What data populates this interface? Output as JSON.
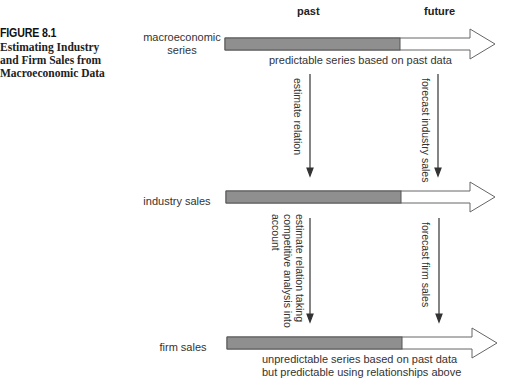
{
  "figure": {
    "number": "FIGURE 8.1",
    "title_lines": [
      "Estimating Industry",
      "and Firm Sales from",
      "Macroeconomic Data"
    ]
  },
  "headers": {
    "past": "past",
    "future": "future"
  },
  "rows": [
    {
      "label_lines": [
        "macroeconomic",
        "series"
      ],
      "note_lines": [
        "predictable series based on past data"
      ]
    },
    {
      "label_lines": [
        "industry sales"
      ],
      "note_lines": []
    },
    {
      "label_lines": [
        "firm sales"
      ],
      "note_lines": [
        "unpredictable series based on past data",
        "but predictable using relationships above"
      ]
    }
  ],
  "vertical_arrows": [
    {
      "text_lines": [
        "estimate relation"
      ]
    },
    {
      "text_lines": [
        "forecast industry sales"
      ]
    },
    {
      "text_lines": [
        "estimate relation taking",
        "competitive analysis into",
        "account"
      ]
    },
    {
      "text_lines": [
        "forecast firm sales"
      ]
    }
  ],
  "colors": {
    "past_fill": "#8f8f8f",
    "future_fill": "#ffffff",
    "stroke": "#555555",
    "text": "#333333"
  }
}
